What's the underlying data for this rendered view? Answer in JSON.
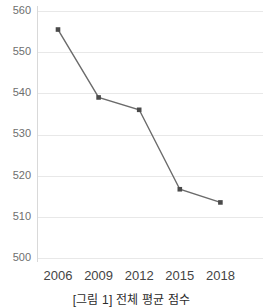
{
  "caption": "[그림 1] 전체 평균 점수",
  "colors": {
    "line": "#6b6b6b",
    "marker": "#4a4a4a",
    "grid": "#e8e8e8",
    "spine": "#d9d9d9",
    "ytick_text": "#6e6e6e",
    "xtick_text": "#444444",
    "background": "#ffffff"
  },
  "chart_data": {
    "type": "line",
    "title": "",
    "subtitle": "",
    "xlabel": "",
    "ylabel": "",
    "categories": [
      "2006",
      "2009",
      "2012",
      "2015",
      "2018"
    ],
    "x": [
      2006,
      2009,
      2012,
      2015,
      2018
    ],
    "values": [
      555.5,
      539.0,
      536.0,
      516.7,
      513.5
    ],
    "series": [
      {
        "name": "전체 평균 점수",
        "values": [
          555.5,
          539.0,
          536.0,
          516.7,
          513.5
        ]
      }
    ],
    "ylim": [
      500,
      560
    ],
    "yticks": [
      500,
      510,
      520,
      530,
      540,
      550,
      560
    ],
    "ytick_labels": [
      "500",
      "510",
      "520",
      "530",
      "540",
      "550",
      "560"
    ],
    "xtick_labels": [
      "2006",
      "2009",
      "2012",
      "2015",
      "2018"
    ],
    "grid": true,
    "grid_axis": "y",
    "legend": false,
    "legend_position": "none",
    "markers": true,
    "annotations": []
  }
}
